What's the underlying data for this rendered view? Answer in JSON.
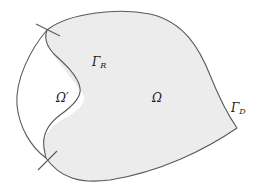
{
  "diagram": {
    "type": "domain-decomposition",
    "colors": {
      "background": "#ffffff",
      "omega_fill": "#ececec",
      "stroke": "#5a5a5a",
      "text": "#1a1a1a"
    },
    "labels": {
      "gamma_r": {
        "base": "Γ",
        "sub": "R"
      },
      "omega_prime": {
        "text": "Ω′"
      },
      "omega": {
        "text": "Ω"
      },
      "gamma_d": {
        "base": "Γ",
        "sub": "D"
      }
    },
    "regions": [
      {
        "id": "omega",
        "label": "Ω",
        "shaded": true
      },
      {
        "id": "omega-prime",
        "label": "Ω′",
        "shaded": false
      }
    ],
    "boundaries": [
      {
        "id": "gamma-r",
        "label": "Γ_R",
        "description": "interface between Ω′ and Ω"
      },
      {
        "id": "gamma-d",
        "label": "Γ_D",
        "description": "outer boundary of Ω"
      }
    ]
  }
}
